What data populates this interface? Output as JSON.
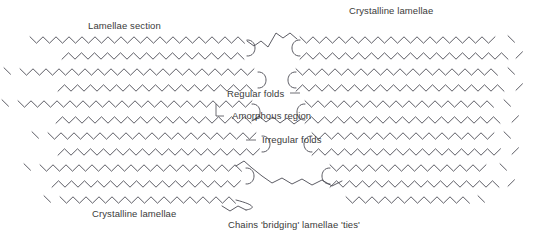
{
  "figure": {
    "background_color": "#ffffff",
    "stroke_color": "#4a4a52",
    "text_color": "#3a3a3a",
    "width": 552,
    "height": 240
  },
  "labels": {
    "lamellae_section": "Lamellae section",
    "crystalline_lamellae_top": "Crystalline lamellae",
    "regular_folds": "Regular folds",
    "amorphous_region": "Amorphous region",
    "irregular_folds": "Irregular folds",
    "crystalline_lamellae_bottom": "Crystalline lamellae",
    "chains_bridging": "Chains 'bridging' lamellae 'ties'"
  },
  "chart_data": {
    "type": "diagram",
    "annotations": [
      {
        "id": "lamellae-section",
        "text": "Lamellae section",
        "x": 88,
        "y": 20,
        "leader": false
      },
      {
        "id": "crystalline-lamellae-top",
        "text": "Crystalline lamellae",
        "x": 349,
        "y": 5,
        "leader": false
      },
      {
        "id": "regular-folds",
        "text": "Regular folds",
        "x": 227,
        "y": 88,
        "leader": true
      },
      {
        "id": "amorphous-region",
        "text": "Amorphous region",
        "x": 232,
        "y": 110,
        "leader": true
      },
      {
        "id": "irregular-folds",
        "text": "Irregular folds",
        "x": 262,
        "y": 134,
        "leader": true
      },
      {
        "id": "crystalline-lamellae-bot",
        "text": "Crystalline lamellae",
        "x": 92,
        "y": 208,
        "leader": false
      },
      {
        "id": "chains-bridging",
        "text": "Chains 'bridging' lamellae 'ties'",
        "x": 228,
        "y": 219,
        "leader": false
      }
    ],
    "chain_rows": 11,
    "row_spacing_px": 16,
    "zigzag_period_px": 13,
    "zigzag_amplitude_px": 3.2,
    "stacks": [
      {
        "name": "left-stack",
        "x_range": [
          8,
          290
        ],
        "rows": 11,
        "fold_edge": "right"
      },
      {
        "name": "right-stack",
        "x_range": [
          278,
          548
        ],
        "rows": 11,
        "fold_edge": "left"
      }
    ]
  }
}
